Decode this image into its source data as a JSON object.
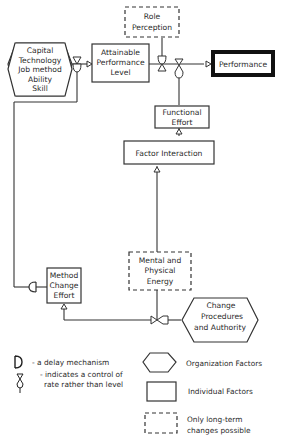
{
  "nodes": {
    "org_factors": {
      "lines": [
        "Capital",
        "Technology",
        "Job method",
        "Ability",
        "Skill"
      ]
    },
    "attainable": {
      "lines": [
        "Attainable",
        "Performance",
        "Level"
      ]
    },
    "role": {
      "lines": [
        "Role",
        "Perception"
      ]
    },
    "performance": {
      "label": "Performance"
    },
    "functional": {
      "lines": [
        "Functional",
        "Effort"
      ]
    },
    "factor": {
      "label": "Factor Interaction"
    },
    "mental": {
      "lines": [
        "Mental and",
        "Physical",
        "Energy"
      ]
    },
    "method": {
      "lines": [
        "Method",
        "Change",
        "Effort"
      ]
    },
    "change": {
      "lines": [
        "Change",
        "Procedures",
        "and Authority"
      ]
    }
  },
  "legend": {
    "delay": "- a delay mechanism",
    "control_1": "- indicates a control of",
    "control_2": "rate rather than level",
    "org": "Organization Factors",
    "ind": "Individual Factors",
    "lt_1": "Only long-term",
    "lt_2": "changes possible"
  },
  "colors": {
    "stroke": "#333333",
    "background": "#ffffff"
  }
}
